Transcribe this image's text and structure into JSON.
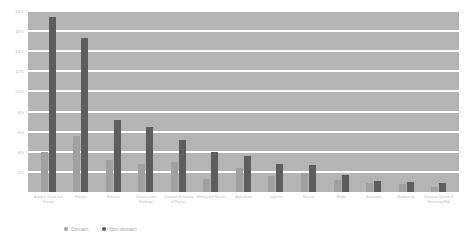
{
  "chart_data": {
    "type": "bar",
    "title": "",
    "xlabel": "",
    "ylabel": "",
    "ylim": [
      0,
      18
    ],
    "grid": true,
    "legend_position": "bottom-left",
    "ytick_labels": [
      "18%",
      "16%",
      "14%",
      "12%",
      "10%",
      "8%",
      "6%",
      "4%",
      "2%"
    ],
    "ytick_values": [
      18,
      16,
      14,
      12,
      10,
      8,
      6,
      4,
      2
    ],
    "categories": [
      "Aviation Travel and Tourism",
      "Forests",
      "Materials",
      "Infrastructure Buildings",
      "Quantum Economy & Physics",
      "Mining and Metals",
      "Agriculture",
      "Logistics",
      "Security",
      "Media",
      "Sanitation",
      "Biodiversity",
      "Financial System & Monitoring Risk"
    ],
    "series": [
      {
        "name": "Domain",
        "color": "#a0a0a0",
        "values": [
          4.0,
          5.6,
          3.2,
          2.8,
          3.0,
          1.3,
          2.4,
          1.6,
          1.9,
          1.2,
          0.9,
          0.8,
          0.5
        ]
      },
      {
        "name": "Non-domain",
        "color": "#5d5d5d",
        "values": [
          17.4,
          15.3,
          7.2,
          6.5,
          5.2,
          4.0,
          3.6,
          2.8,
          2.7,
          1.7,
          1.1,
          1.0,
          0.9
        ]
      }
    ]
  },
  "legend": {
    "items": [
      {
        "label": "Domain",
        "color": "#a0a0a0"
      },
      {
        "label": "Non-domain",
        "color": "#5d5d5d"
      }
    ]
  }
}
